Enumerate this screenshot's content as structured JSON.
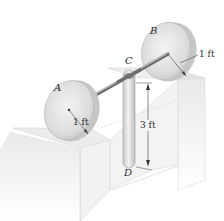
{
  "figure": {
    "labels": {
      "disk_a": "A",
      "disk_b": "B",
      "point_c": "C",
      "point_d": "D"
    },
    "dimensions": {
      "radius_a": "1 ft",
      "radius_b": "1 ft",
      "bar_length": "3 ft"
    },
    "colors": {
      "disk_face": "#e4e4e4",
      "disk_rim": "#c9c9c9",
      "block_face": "#f0f0f0",
      "line": "#555555",
      "text": "#2a2a2a"
    }
  }
}
